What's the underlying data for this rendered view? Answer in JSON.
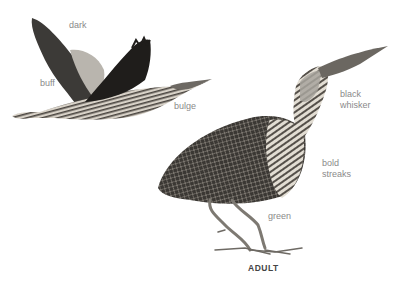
{
  "figure": {
    "caption": "ADULT",
    "labels": {
      "dark": "dark",
      "buff": "buff",
      "bulge": "bulge",
      "black_whisker_1": "black",
      "black_whisker_2": "whisker",
      "bold_streaks_1": "bold",
      "bold_streaks_2": "streaks",
      "green": "green"
    },
    "colors": {
      "background": "#ffffff",
      "label": "#8a8a8a",
      "caption": "#444444"
    }
  }
}
